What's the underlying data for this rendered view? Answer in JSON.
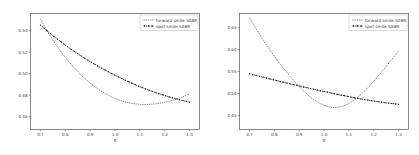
{
  "figure": {
    "panel_count": 2,
    "background_color": "#ffffff"
  },
  "chart_data": [
    {
      "id": "left",
      "type": "line",
      "title": "",
      "xlabel": "K",
      "ylabel": "",
      "xlim": [
        0.66,
        1.34
      ],
      "ylim": [
        0.448,
        0.556
      ],
      "grid": false,
      "legend_position": "upper right",
      "xticks": [
        "0.7",
        "0.8",
        "0.9",
        "1.0",
        "1.1",
        "1.2",
        "1.3"
      ],
      "xtick_values": [
        0.7,
        0.8,
        0.9,
        1.0,
        1.1,
        1.2,
        1.3
      ],
      "yticks": [
        "0.54",
        "0.52",
        "0.50",
        "0.48",
        "0.46"
      ],
      "ytick_values": [
        0.54,
        0.52,
        0.5,
        0.48,
        0.46
      ],
      "x": [
        0.7,
        0.73,
        0.76,
        0.79,
        0.82,
        0.85,
        0.88,
        0.91,
        0.94,
        0.97,
        1.0,
        1.03,
        1.06,
        1.09,
        1.12,
        1.15,
        1.18,
        1.21,
        1.24,
        1.27,
        1.3
      ],
      "series": [
        {
          "name": "forward smile SABR",
          "style": "dotted",
          "markers": false,
          "color": "#4d4d4d",
          "values": [
            0.5505,
            0.5385,
            0.5278,
            0.5182,
            0.5096,
            0.5019,
            0.4952,
            0.4894,
            0.4844,
            0.4803,
            0.477,
            0.4745,
            0.4727,
            0.4717,
            0.4713,
            0.4716,
            0.4725,
            0.4739,
            0.4758,
            0.4782,
            0.481
          ]
        },
        {
          "name": "spot smile SABR",
          "style": "dotted-markers",
          "markers": true,
          "color": "#1a1a1a",
          "values": [
            0.5452,
            0.5392,
            0.5336,
            0.5283,
            0.5233,
            0.5186,
            0.5141,
            0.5099,
            0.5059,
            0.5021,
            0.4985,
            0.4951,
            0.4919,
            0.4889,
            0.4861,
            0.4835,
            0.4811,
            0.4789,
            0.4769,
            0.4751,
            0.4735
          ]
        }
      ]
    },
    {
      "id": "right",
      "type": "line",
      "title": "",
      "xlabel": "K",
      "ylabel": "",
      "xlim": [
        0.66,
        1.34
      ],
      "ylim": [
        0.418,
        0.682
      ],
      "grid": false,
      "legend_position": "upper right",
      "xticks": [
        "0.7",
        "0.8",
        "0.9",
        "1.0",
        "1.1",
        "1.2",
        "1.3"
      ],
      "xtick_values": [
        0.7,
        0.8,
        0.9,
        1.0,
        1.1,
        1.2,
        1.3
      ],
      "yticks": [
        "0.65",
        "0.60",
        "0.55",
        "0.50",
        "0.45"
      ],
      "ytick_values": [
        0.65,
        0.6,
        0.55,
        0.5,
        0.45
      ],
      "x": [
        0.7,
        0.73,
        0.76,
        0.79,
        0.82,
        0.85,
        0.88,
        0.91,
        0.94,
        0.97,
        1.0,
        1.03,
        1.06,
        1.09,
        1.12,
        1.15,
        1.18,
        1.21,
        1.24,
        1.27,
        1.3
      ],
      "series": [
        {
          "name": "forward smile SABR",
          "style": "dotted",
          "markers": false,
          "color": "#4d4d4d",
          "values": [
            0.672,
            0.6445,
            0.618,
            0.593,
            0.5695,
            0.548,
            0.528,
            0.51,
            0.4945,
            0.482,
            0.473,
            0.4685,
            0.469,
            0.4745,
            0.4845,
            0.4985,
            0.5155,
            0.5345,
            0.5545,
            0.5755,
            0.596
          ]
        },
        {
          "name": "spot smile SABR",
          "style": "dotted-markers",
          "markers": true,
          "color": "#1a1a1a",
          "values": [
            0.5448,
            0.5405,
            0.5362,
            0.532,
            0.5279,
            0.5238,
            0.5198,
            0.5159,
            0.512,
            0.5082,
            0.5045,
            0.5008,
            0.4973,
            0.4939,
            0.4906,
            0.4875,
            0.4846,
            0.4819,
            0.4795,
            0.4773,
            0.4754
          ]
        }
      ]
    }
  ]
}
